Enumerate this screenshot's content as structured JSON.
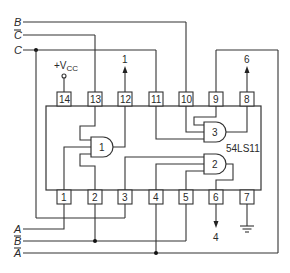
{
  "figure": {
    "type": "logic circuit wiring diagram",
    "chip": {
      "part_number": "54LS11",
      "description": "Triple 3-input AND gate IC"
    },
    "input_signals": {
      "top": [
        {
          "label": "B",
          "overbar": false
        },
        {
          "label": "C",
          "overbar": true
        },
        {
          "label": "C",
          "overbar": false
        }
      ],
      "bottom": [
        {
          "label": "A",
          "overbar": false
        },
        {
          "label": "B",
          "overbar": true
        },
        {
          "label": "A",
          "overbar": true
        }
      ]
    },
    "supply": {
      "vcc_label_prefix": "+V",
      "vcc_label_sub": "CC",
      "vcc_pin": "14",
      "ground_pin": "7"
    },
    "pins_top": [
      "14",
      "13",
      "12",
      "11",
      "10",
      "9",
      "8"
    ],
    "pins_bottom": [
      "1",
      "2",
      "3",
      "4",
      "5",
      "6",
      "7"
    ],
    "gates": [
      "1",
      "2",
      "3"
    ],
    "outputs": [
      {
        "pin": "12",
        "label": "1"
      },
      {
        "pin": "8",
        "label": "6"
      },
      {
        "pin": "6",
        "label": "4"
      }
    ]
  }
}
